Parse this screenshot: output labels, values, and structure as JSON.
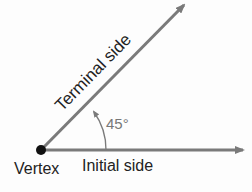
{
  "diagram": {
    "labels": {
      "terminal": "Terminal side",
      "initial": "Initial side",
      "vertex": "Vertex",
      "angle": "45°"
    },
    "colors": {
      "ray": "#7a7a7a",
      "vertex": "#111111",
      "text": "#222222",
      "angle_text": "#777777"
    }
  }
}
